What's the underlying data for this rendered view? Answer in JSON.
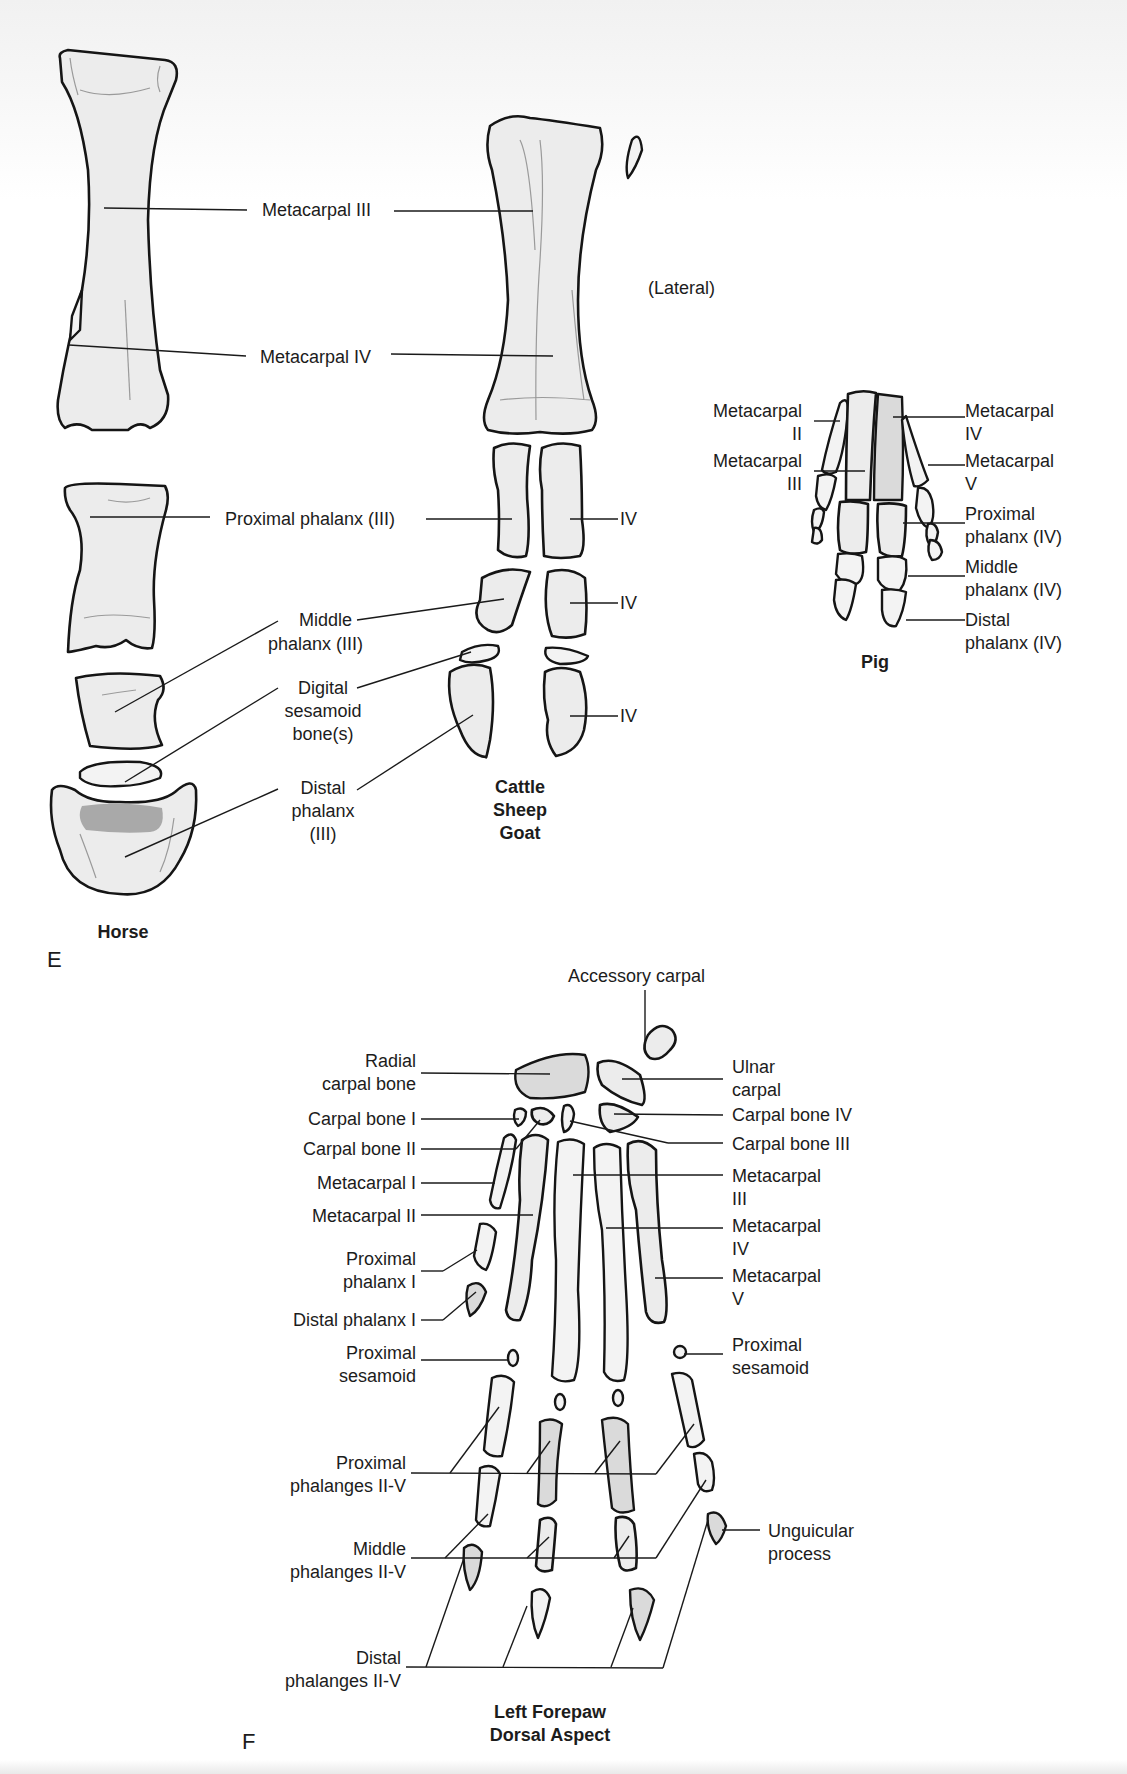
{
  "figure": {
    "panel_e": {
      "letter": "E",
      "view_note": "(Lateral)",
      "species": {
        "horse": {
          "caption": "Horse",
          "labels": {
            "metacarpal_iii": "Metacarpal III",
            "metacarpal_iv": "Metacarpal IV",
            "proximal_phalanx": "Proximal phalanx (III)",
            "middle_phalanx_l1": "Middle",
            "middle_phalanx_l2": "phalanx (III)",
            "digital_sesamoid_l1": "Digital",
            "digital_sesamoid_l2": "sesamoid",
            "digital_sesamoid_l3": "bone(s)",
            "distal_phalanx_l1": "Distal",
            "distal_phalanx_l2": "phalanx",
            "distal_phalanx_l3": "(III)"
          }
        },
        "ruminant": {
          "caption_l1": "Cattle",
          "caption_l2": "Sheep",
          "caption_l3": "Goat",
          "labels": {
            "proximal_iv": "IV",
            "middle_iv": "IV",
            "distal_iv": "IV"
          }
        },
        "pig": {
          "caption": "Pig",
          "labels": {
            "mc2_l1": "Metacarpal",
            "mc2_l2": "II",
            "mc3_l1": "Metacarpal",
            "mc3_l2": "III",
            "mc4_l1": "Metacarpal",
            "mc4_l2": "IV",
            "mc5_l1": "Metacarpal",
            "mc5_l2": "V",
            "prox_l1": "Proximal",
            "prox_l2": "phalanx (IV)",
            "mid_l1": "Middle",
            "mid_l2": "phalanx (IV)",
            "dist_l1": "Distal",
            "dist_l2": "phalanx (IV)"
          }
        }
      }
    },
    "panel_f": {
      "letter": "F",
      "caption_l1": "Left Forepaw",
      "caption_l2": "Dorsal Aspect",
      "labels_left": {
        "radial_l1": "Radial",
        "radial_l2": "carpal bone",
        "carpal_i": "Carpal bone I",
        "carpal_ii": "Carpal bone II",
        "mc_i": "Metacarpal I",
        "mc_ii": "Metacarpal II",
        "prox_phal_i_l1": "Proximal",
        "prox_phal_i_l2": "phalanx I",
        "dist_phal_i": "Distal phalanx I",
        "prox_ses_l1": "Proximal",
        "prox_ses_l2": "sesamoid",
        "prox_phals_l1": "Proximal",
        "prox_phals_l2": "phalanges II-V",
        "mid_phals_l1": "Middle",
        "mid_phals_l2": "phalanges II-V",
        "dist_phals_l1": "Distal",
        "dist_phals_l2": "phalanges II-V"
      },
      "labels_right": {
        "accessory": "Accessory carpal",
        "ulnar_l1": "Ulnar",
        "ulnar_l2": "carpal",
        "carpal_iv": "Carpal bone IV",
        "carpal_iii": "Carpal bone III",
        "mc_iii_l1": "Metacarpal",
        "mc_iii_l2": "III",
        "mc_iv_l1": "Metacarpal",
        "mc_iv_l2": "IV",
        "mc_v_l1": "Metacarpal",
        "mc_v_l2": "V",
        "prox_ses_l1": "Proximal",
        "prox_ses_l2": "sesamoid",
        "unguicular_l1": "Unguicular",
        "unguicular_l2": "process"
      }
    },
    "colors": {
      "background": "#ffffff",
      "bone_fill": "#ececec",
      "outline": "#151515",
      "cartilage_shade": "#a9a9a9",
      "text": "#1c1c1c"
    }
  }
}
